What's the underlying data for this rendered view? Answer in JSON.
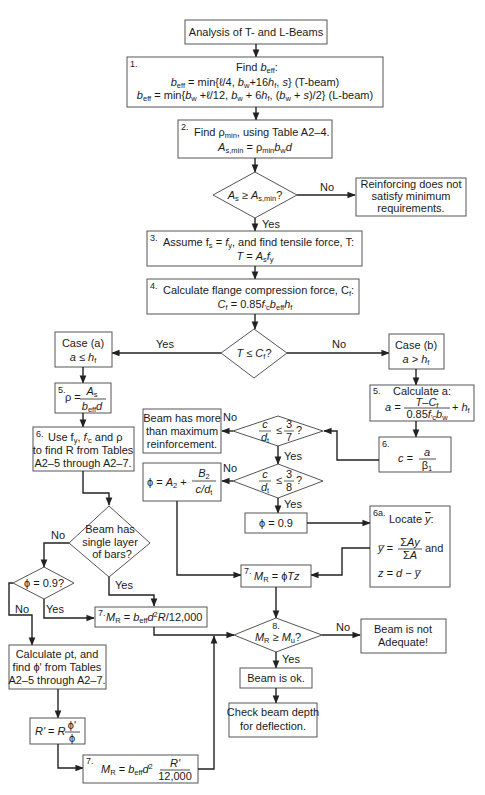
{
  "title": "Analysis of T- and L-Beams",
  "steps": {
    "s1": {
      "num": "1.",
      "head": "Find b_eff:",
      "line1": "b_eff = min{ℓ/4, b_w+16h_f, s}   (T-beam)",
      "line2": "b_eff = min{b_w + ℓ/12, b_w + 6h_f, (b_w + s)/2}   (L-beam)"
    },
    "s2": {
      "num": "2.",
      "line1": "Find ρ_min, using Table A2–4.",
      "line2": "A_s,min = ρ_min b_w d"
    },
    "d_asmin": {
      "text": "A_s ≥ A_s,min?",
      "no": "No",
      "yes": "Yes"
    },
    "fail_min": {
      "line1": "Reinforcing does not",
      "line2": "satisfy minimum",
      "line3": "requirements."
    },
    "s3": {
      "num": "3.",
      "line1": "Assume f_s = f_y, and find tensile force, T:",
      "line2": "T = A_s f_y"
    },
    "s4": {
      "num": "4.",
      "line1": "Calculate flange compression force, C_f:",
      "line2": "C_f = 0.85f'_c b_eff h_f"
    },
    "d_tcf": {
      "text": "T ≤ C_f?",
      "yes": "Yes",
      "no": "No"
    },
    "case_a": {
      "line1": "Case (a)",
      "line2": "a ≤ h_f"
    },
    "case_b": {
      "line1": "Case (b)",
      "line2": "a > h_f"
    },
    "s5a": {
      "num": "5.",
      "text": "ρ = A_s / (b_eff d)"
    },
    "s6a": {
      "num": "6.",
      "line1": "Use f_y, f'_c and ρ",
      "line2": "to find R from Tables",
      "line3": "A2–5 through A2–7."
    },
    "s5b": {
      "num": "5.",
      "line1": "Calculate a:",
      "line2": "a = (T−C_f)/(0.85f'_c b_w) + h_f"
    },
    "s6b": {
      "num": "6.",
      "text": "c = a/β1"
    },
    "d_37": {
      "text": "c/d_t ≤ 3/7?",
      "no": "No",
      "yes": "Yes"
    },
    "over_reinf": {
      "line1": "Beam has more",
      "line2": "than maximum",
      "line3": "reinforcement."
    },
    "d_38": {
      "text": "c/d_t ≤ 3/8?",
      "no": "No",
      "yes": "Yes"
    },
    "phi_trans": {
      "text": "ϕ = A2 + B2/(c/d_t)"
    },
    "phi_09": {
      "text": "ϕ = 0.9"
    },
    "s6a_locate": {
      "num": "6a.",
      "line1": "Locate ȳ:",
      "line2": "ȳ = ΣAy/ΣA and",
      "line3": "z = d − ȳ"
    },
    "s7_phitz": {
      "num": "7.",
      "text": "M_R = ϕTz"
    },
    "d_single": {
      "line1": "Beam has",
      "line2": "single layer",
      "line3": "of bars?",
      "no": "No",
      "yes": "Yes"
    },
    "d_phi09": {
      "text": "ϕ = 0.9?",
      "no": "No",
      "yes": "Yes"
    },
    "s7_r": {
      "num": "7.",
      "text": "M_R = b_eff d² R/12,000"
    },
    "calc_rho_t": {
      "line1": "Calculate ρt, and",
      "line2": "find ϕ' from Tables",
      "line3": "A2–5 through A2–7."
    },
    "r_prime": {
      "text": "R' = R ϕ'/ϕ"
    },
    "s7_rprime": {
      "num": "7.",
      "text": "M_R = b_eff d² R'/12,000"
    },
    "d_mu": {
      "num": "8.",
      "text": "M_R ≥ M_u?",
      "no": "No",
      "yes": "Yes"
    },
    "not_adequate": {
      "line1": "Beam is not",
      "line2": "Adequate!"
    },
    "ok": {
      "text": "Beam is ok."
    },
    "check_depth": {
      "line1": "Check beam depth",
      "line2": "for deflection."
    }
  },
  "render": {
    "title": "Analysis of T- and L-Beams",
    "s1_num": "1.",
    "s1_find": "Find ",
    "s1_b": "b",
    "s1_eff": "eff",
    "s1_colon": ":",
    "s2_num": "2.",
    "s2_a": "Find ρ",
    "s2_min": "min",
    "s2_b": ", using Table A2–4.",
    "fail_1": "Reinforcing does not",
    "fail_2": "satisfy minimum",
    "fail_3": "requirements.",
    "no": "No",
    "yes": "Yes",
    "s3_num": "3.",
    "s3_line": "Assume f",
    "s3_rest": ", and find tensile force, T:",
    "s4_num": "4.",
    "s4_line": "Calculate flange compression force, C",
    "case_a1": "Case (a)",
    "case_b1": "Case (b)",
    "s5_num": "5.",
    "s6_num": "6.",
    "s6a_1": "Use f",
    "s6a_2": "to find R from Tables",
    "s6a_3": "A2–5 through A2–7.",
    "s5b_1": "Calculate a:",
    "over_1": "Beam has more",
    "over_2": "than maximum",
    "over_3": "reinforcement.",
    "phi09": "ϕ = 0.9",
    "s6a_num": "6a.",
    "locate": "Locate ",
    "and": "and",
    "s7_num": "7.",
    "single_1": "Beam has",
    "single_2": "single layer",
    "single_3": "of bars?",
    "phi09q": "ϕ = 0.9?",
    "calc_1": "Calculate ρt, and",
    "calc_2": "find ϕ' from Tables",
    "calc_3": "A2–5 through A2–7.",
    "s8_num": "8.",
    "na_1": "Beam is not",
    "na_2": "Adequate!",
    "ok": "Beam is ok.",
    "chk_1": "Check beam depth",
    "chk_2": "for deflection.",
    "r12000": "12,000"
  },
  "colors": {
    "line": "#222222",
    "box_border": "#555555",
    "background": "#ffffff"
  }
}
